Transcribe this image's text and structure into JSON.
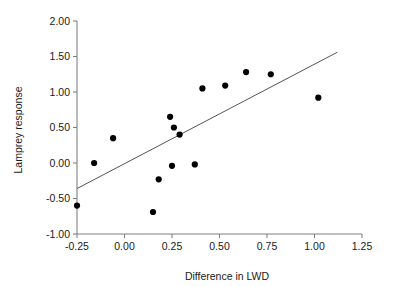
{
  "chart_data": {
    "type": "scatter",
    "title": "",
    "xlabel": "Difference in LWD",
    "ylabel": "Lamprey response",
    "xlim": [
      -0.25,
      1.25
    ],
    "ylim": [
      -1.0,
      2.0
    ],
    "xticks": [
      "-0.25",
      "0.00",
      "0.25",
      "0.50",
      "0.75",
      "1.00",
      "1.25"
    ],
    "xtick_values": [
      -0.25,
      0.0,
      0.25,
      0.5,
      0.75,
      1.0,
      1.25
    ],
    "yticks": [
      "-1.00",
      "-0.50",
      "0.00",
      "0.50",
      "1.00",
      "1.50",
      "2.00"
    ],
    "ytick_values": [
      -1.0,
      -0.5,
      0.0,
      0.5,
      1.0,
      1.5,
      2.0
    ],
    "grid": false,
    "legend": null,
    "marker": "filled-circle",
    "marker_color": "#000000",
    "points": [
      {
        "x": -0.25,
        "y": -0.6
      },
      {
        "x": -0.16,
        "y": 0.0
      },
      {
        "x": -0.06,
        "y": 0.35
      },
      {
        "x": 0.15,
        "y": -0.69
      },
      {
        "x": 0.18,
        "y": -0.23
      },
      {
        "x": 0.24,
        "y": 0.65
      },
      {
        "x": 0.25,
        "y": -0.04
      },
      {
        "x": 0.26,
        "y": 0.5
      },
      {
        "x": 0.29,
        "y": 0.4
      },
      {
        "x": 0.37,
        "y": -0.02
      },
      {
        "x": 0.41,
        "y": 1.05
      },
      {
        "x": 0.53,
        "y": 1.09
      },
      {
        "x": 0.64,
        "y": 1.28
      },
      {
        "x": 0.77,
        "y": 1.25
      },
      {
        "x": 1.02,
        "y": 0.92
      }
    ],
    "trend_line": {
      "type": "linear-fit",
      "color": "#555555",
      "x_start": -0.25,
      "y_start": -0.36,
      "x_end": 1.12,
      "y_end": 1.56
    }
  }
}
